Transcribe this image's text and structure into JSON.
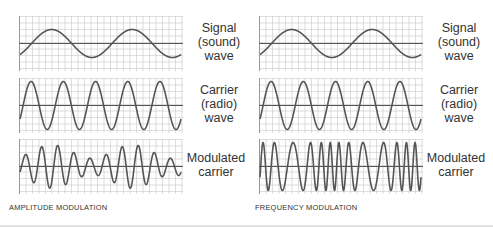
{
  "diagram": {
    "colors": {
      "grid": "#c8c8c8",
      "grid_border": "#9a9a9a",
      "axis": "#555555",
      "wave": "#555555",
      "text": "#333333"
    },
    "columns": [
      {
        "id": "amplitude",
        "caption": "AMPLITUDE MODULATION",
        "panels": [
          {
            "id": "signal",
            "label_lines": [
              "Signal",
              "(sound)",
              "wave"
            ],
            "waveform": "signal_sine",
            "cycles": 2
          },
          {
            "id": "carrier",
            "label_lines": [
              "Carrier",
              "(radio)",
              "wave"
            ],
            "waveform": "carrier",
            "cycles": 5
          },
          {
            "id": "modulated",
            "label_lines": [
              "Modulated",
              "carrier"
            ],
            "waveform": "am",
            "cycles": 10
          }
        ]
      },
      {
        "id": "frequency",
        "caption": "FREQUENCY MODULATION",
        "panels": [
          {
            "id": "signal",
            "label_lines": [
              "Signal",
              "(sound)",
              "wave"
            ],
            "waveform": "signal_sine",
            "cycles": 2
          },
          {
            "id": "carrier",
            "label_lines": [
              "Carrier",
              "(radio)",
              "wave"
            ],
            "waveform": "carrier",
            "cycles": 5
          },
          {
            "id": "modulated",
            "label_lines": [
              "Modulated",
              "carrier"
            ],
            "waveform": "fm",
            "cycles": 13
          }
        ]
      }
    ]
  }
}
